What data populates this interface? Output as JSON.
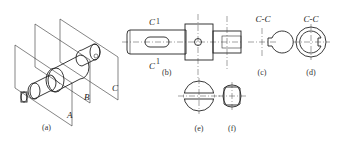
{
  "figure": {
    "panels": [
      {
        "id": "a",
        "caption": "(a)",
        "description": "isometric view of shaft with cutting planes",
        "plane_labels": [
          "A",
          "B",
          "C"
        ]
      },
      {
        "id": "b",
        "caption": "(b)",
        "description": "front view of shaft",
        "section_label_top": "C",
        "section_label_bottom": "C",
        "section_mark": "1"
      },
      {
        "id": "c",
        "caption": "(c)",
        "title": "C-C",
        "description": "section with keyway"
      },
      {
        "id": "d",
        "caption": "(d)",
        "title": "C-C",
        "description": "section with outer ring and keyway"
      },
      {
        "id": "e",
        "caption": "(e)",
        "description": "section through cross hole"
      },
      {
        "id": "f",
        "caption": "(f)",
        "description": "section with flats"
      }
    ]
  }
}
